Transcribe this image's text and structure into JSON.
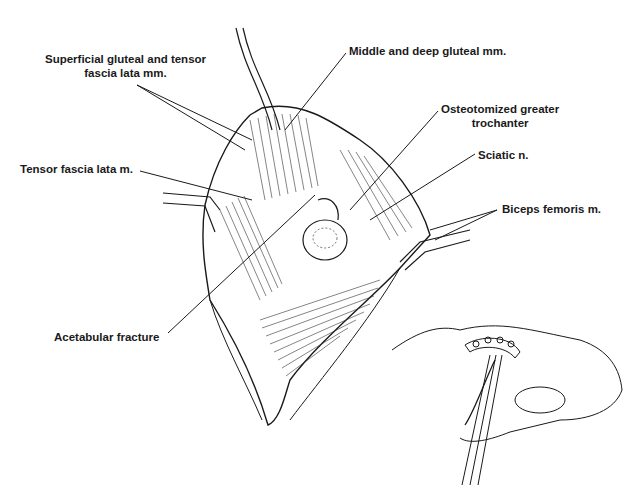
{
  "figure": {
    "type": "anatomical-illustration",
    "colors": {
      "ink": "#1a1a1a",
      "background": "#ffffff"
    },
    "labels": [
      {
        "id": "superficial-gluteal",
        "lines": [
          "Superficial gluteal and tensor",
          "fascia lata mm."
        ]
      },
      {
        "id": "middle-deep-gluteal",
        "lines": [
          "Middle and deep gluteal mm."
        ]
      },
      {
        "id": "osteotomized-trochanter",
        "lines": [
          "Osteotomized greater",
          "trochanter"
        ]
      },
      {
        "id": "tensor-fascia-lata",
        "lines": [
          "Tensor fascia lata m."
        ]
      },
      {
        "id": "sciatic-nerve",
        "lines": [
          "Sciatic n."
        ]
      },
      {
        "id": "biceps-femoris",
        "lines": [
          "Biceps femoris m."
        ]
      },
      {
        "id": "acetabular-fracture",
        "lines": [
          "Acetabular fracture"
        ]
      }
    ],
    "inset": {
      "description": "pelvis with reconstruction plate and screws, reduction clamp"
    }
  }
}
